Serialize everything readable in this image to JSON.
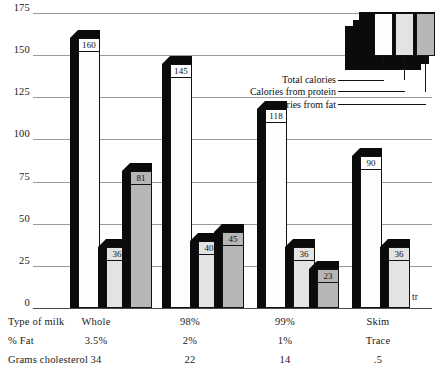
{
  "chart_data": {
    "type": "bar",
    "title": "",
    "subtitle": "",
    "xlabel": "",
    "ylabel": "",
    "ylim": [
      0,
      175
    ],
    "yticks": [
      0,
      25,
      50,
      75,
      100,
      125,
      150,
      175
    ],
    "ytick_labels": [
      "0",
      "25",
      "50",
      "75",
      "100",
      "125",
      "150",
      "175"
    ],
    "grid": true,
    "legend_position": "top-right",
    "categories": [
      "Whole",
      "98%",
      "99%",
      "Skim"
    ],
    "series": [
      {
        "name": "Total calories",
        "values": [
          160,
          145,
          118,
          90
        ],
        "labels": [
          "160",
          "145",
          "118",
          "90"
        ],
        "fill": "#fdfdfd"
      },
      {
        "name": "Calories from protein",
        "values": [
          36,
          40,
          36,
          36
        ],
        "labels": [
          "36",
          "40",
          "36",
          "36"
        ],
        "fill": "#e3e3e3"
      },
      {
        "name": "Calories from fat",
        "values": [
          81,
          45,
          23,
          0
        ],
        "labels": [
          "81",
          "45",
          "23",
          "tr"
        ],
        "fill": "#b6b6b6"
      }
    ],
    "annotations": [
      {
        "text": "tr",
        "meaning": "trace",
        "category": "Skim",
        "series": "Calories from fat"
      }
    ]
  },
  "legend": {
    "items": [
      {
        "label": "Total calories",
        "swatch": "white"
      },
      {
        "label": "Calories from protein",
        "swatch": "light-gray"
      },
      {
        "label": "Calories from fat",
        "swatch": "medium-gray"
      }
    ]
  },
  "table": {
    "rows": [
      {
        "header": "Type of milk",
        "values": [
          "Whole",
          "98%",
          "99%",
          "Skim"
        ]
      },
      {
        "header": "% Fat",
        "values": [
          "3.5%",
          "2%",
          "1%",
          "Trace"
        ]
      },
      {
        "header": "Grams cholesterol",
        "values": [
          "34",
          "22",
          "14",
          ".5"
        ]
      }
    ]
  },
  "colors": {
    "total": "#fdfdfd",
    "protein": "#e3e3e3",
    "fat": "#b6b6b6",
    "shadow": "#0b0b0b",
    "gridline": "#9a9a9a",
    "axis": "#4a4a4a"
  }
}
